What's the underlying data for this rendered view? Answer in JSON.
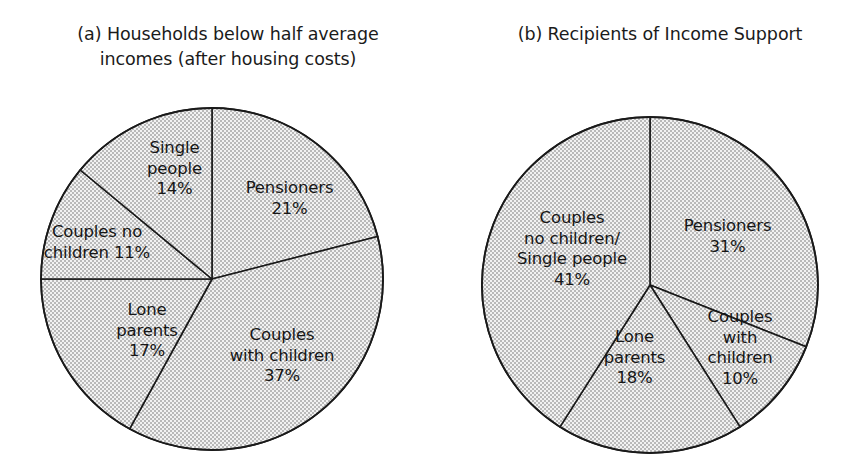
{
  "figure": {
    "background_color": "#ffffff",
    "slice_fill_color": "#eeeeee",
    "slice_stipple_color": "#9a9a9a",
    "outline_color": "#1a1a1a"
  },
  "charts": [
    {
      "id": "chart-a",
      "title": "(a) Households below half average\nincomes (after housing costs)",
      "title_lines": [
        "(a) Households below half average",
        "incomes (after housing costs)"
      ],
      "center": {
        "x": 212,
        "y": 279
      },
      "radius": 171
    },
    {
      "id": "chart-b",
      "title": "(b) Recipients of Income Support",
      "title_lines": [
        "(b) Recipients of Income Support"
      ],
      "center": {
        "x": 650,
        "y": 285
      },
      "radius": 168
    }
  ],
  "labels_a": [
    {
      "name": "single-people",
      "text": "Single\npeople\n14%"
    },
    {
      "name": "couples-no-children",
      "text": "Couples no\nchildren 11%"
    },
    {
      "name": "lone-parents",
      "text": "Lone\nparents\n17%"
    },
    {
      "name": "couples-with-children",
      "text": "Couples\nwith children\n37%"
    },
    {
      "name": "pensioners",
      "text": "Pensioners\n21%"
    }
  ],
  "labels_b": [
    {
      "name": "couples-no-children-single-people",
      "text": "Couples\nno children/\nSingle people\n41%"
    },
    {
      "name": "lone-parents",
      "text": "Lone\nparents\n18%"
    },
    {
      "name": "couples-with-children",
      "text": "Couples\nwith\nchildren\n10%"
    },
    {
      "name": "pensioners",
      "text": "Pensioners\n31%"
    }
  ],
  "chart_data": [
    {
      "type": "pie",
      "title": "(a) Households below half average incomes (after housing costs)",
      "panel": "a",
      "categories": [
        "Pensioners",
        "Couples with children",
        "Lone parents",
        "Couples no children",
        "Single people"
      ],
      "values": [
        21,
        37,
        17,
        11,
        14
      ],
      "unit": "%",
      "start_angle_deg": 0,
      "direction": "clockwise",
      "legend": "none",
      "labels_inside": true,
      "slices": [
        {
          "label": "Pensioners",
          "value": 21,
          "display": "21%",
          "start_deg": 0,
          "end_deg": 75.6
        },
        {
          "label": "Couples with children",
          "value": 37,
          "display": "37%",
          "start_deg": 75.6,
          "end_deg": 208.8
        },
        {
          "label": "Lone parents",
          "value": 17,
          "display": "17%",
          "start_deg": 208.8,
          "end_deg": 270.0
        },
        {
          "label": "Couples no children",
          "value": 11,
          "display": "11%",
          "start_deg": 270.0,
          "end_deg": 309.6
        },
        {
          "label": "Single people",
          "value": 14,
          "display": "14%",
          "start_deg": 309.6,
          "end_deg": 360.0
        }
      ]
    },
    {
      "type": "pie",
      "title": "(b) Recipients of Income Support",
      "panel": "b",
      "categories": [
        "Pensioners",
        "Couples with children",
        "Lone parents",
        "Couples no children/Single people"
      ],
      "values": [
        31,
        10,
        18,
        41
      ],
      "unit": "%",
      "start_angle_deg": 0,
      "direction": "clockwise",
      "legend": "none",
      "labels_inside": true,
      "slices": [
        {
          "label": "Pensioners",
          "value": 31,
          "display": "31%",
          "start_deg": 0,
          "end_deg": 111.6
        },
        {
          "label": "Couples with children",
          "value": 10,
          "display": "10%",
          "start_deg": 111.6,
          "end_deg": 147.6
        },
        {
          "label": "Lone parents",
          "value": 18,
          "display": "18%",
          "start_deg": 147.6,
          "end_deg": 212.4
        },
        {
          "label": "Couples no children/Single people",
          "value": 41,
          "display": "41%",
          "start_deg": 212.4,
          "end_deg": 360.0
        }
      ]
    }
  ]
}
